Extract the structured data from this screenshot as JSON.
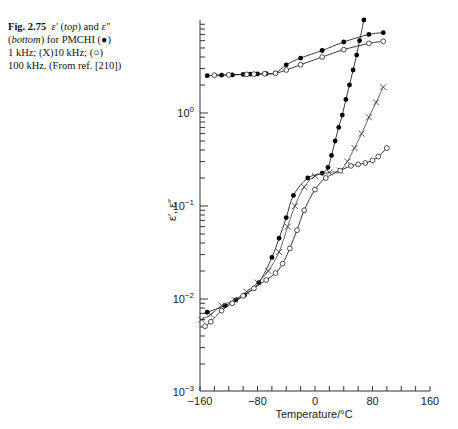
{
  "caption": {
    "figure_label": "Fig. 2.75",
    "eps1": "ε′",
    "top": "top",
    "and": " and ",
    "eps2": "ε″",
    "bottom": "bottom",
    "line2_rest": " for PMCHI (●)",
    "line3": "1 kHz; (X)10 kHz; (○)",
    "line4": "100 kHz. (From ref. [210])"
  },
  "chart_data": {
    "type": "line",
    "title": "ε′ (top) and ε″ (bottom) for PMCHI",
    "xlabel": "Temperature/°C",
    "ylabel": "ε′, ε″",
    "xlim": [
      -160,
      160
    ],
    "ylim": [
      0.001,
      10
    ],
    "yscale": "log",
    "xticks": [
      -160,
      -80,
      0,
      80,
      160
    ],
    "yticks": [
      "10^-3",
      "10^-2",
      "10^-1",
      "10^0"
    ],
    "grid": false,
    "legend": "in caption",
    "series": [
      {
        "name": "ε′ 1 kHz (●)",
        "marker": "filled-circle",
        "x": [
          -150,
          -130,
          -115,
          -100,
          -90,
          -80,
          -68,
          -55,
          -40,
          -20,
          10,
          40,
          75,
          95
        ],
        "y": [
          2.52,
          2.55,
          2.57,
          2.6,
          2.62,
          2.63,
          2.65,
          2.68,
          3.3,
          3.9,
          4.7,
          5.8,
          7.0,
          7.3
        ]
      },
      {
        "name": "ε′ 100 kHz (○)",
        "marker": "open-circle",
        "x": [
          -140,
          -120,
          -95,
          -85,
          -70,
          -55,
          -40,
          -20,
          10,
          40,
          75,
          95
        ],
        "y": [
          2.55,
          2.57,
          2.6,
          2.62,
          2.64,
          2.67,
          2.9,
          3.3,
          4.0,
          4.8,
          5.6,
          5.9
        ]
      },
      {
        "name": "ε″ 1 kHz (●)",
        "marker": "filled-circle",
        "x": [
          -150,
          -125,
          -110,
          -98,
          -78,
          -60,
          -50,
          -40,
          -30,
          -10,
          10,
          18,
          23,
          28,
          33,
          38,
          43,
          48,
          53,
          58,
          62,
          68
        ],
        "y": [
          0.0072,
          0.0085,
          0.0098,
          0.011,
          0.015,
          0.028,
          0.045,
          0.075,
          0.13,
          0.2,
          0.225,
          0.26,
          0.35,
          0.5,
          0.7,
          0.95,
          1.4,
          2.0,
          2.9,
          4.2,
          6.0,
          10
        ]
      },
      {
        "name": "ε″ 10 kHz (X)",
        "marker": "cross",
        "x": [
          -158,
          -145,
          -130,
          -112,
          -95,
          -80,
          -65,
          -50,
          -38,
          -28,
          -15,
          0,
          20,
          35,
          45,
          55,
          65,
          75,
          85,
          95
        ],
        "y": [
          0.006,
          0.0068,
          0.0085,
          0.0098,
          0.012,
          0.015,
          0.02,
          0.032,
          0.06,
          0.1,
          0.16,
          0.21,
          0.23,
          0.24,
          0.3,
          0.42,
          0.6,
          0.9,
          1.3,
          1.9
        ]
      },
      {
        "name": "ε″ 100 kHz (○)",
        "marker": "open-circle",
        "x": [
          -153,
          -145,
          -130,
          -115,
          -100,
          -85,
          -68,
          -55,
          -45,
          -35,
          -25,
          -15,
          0,
          15,
          35,
          50,
          60,
          70,
          80,
          88,
          100
        ],
        "y": [
          0.0051,
          0.0057,
          0.0075,
          0.009,
          0.0108,
          0.013,
          0.016,
          0.019,
          0.024,
          0.035,
          0.055,
          0.09,
          0.15,
          0.2,
          0.24,
          0.27,
          0.28,
          0.29,
          0.31,
          0.34,
          0.42
        ]
      }
    ]
  }
}
